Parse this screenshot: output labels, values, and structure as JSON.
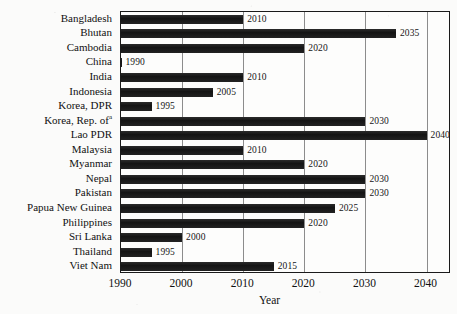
{
  "chart_data": {
    "type": "bar",
    "orientation": "horizontal",
    "title": "",
    "xlabel": "Year",
    "ylabel": "",
    "xlim": [
      1990,
      2044
    ],
    "xticks": [
      1990,
      2000,
      2010,
      2020,
      2030,
      2040
    ],
    "xtick_labels": [
      "1990",
      "2000",
      "2010",
      "2020",
      "2030",
      "2040"
    ],
    "grid": true,
    "grid_axis": "x",
    "legend": "none",
    "bar_color": "#1b1b1b",
    "categories": [
      "Bangladesh",
      "Bhutan",
      "Cambodia",
      "China",
      "India",
      "Indonesia",
      "Korea, DPR",
      "Korea, Rep. of",
      "Lao PDR",
      "Malaysia",
      "Myanmar",
      "Nepal",
      "Pakistan",
      "Papua New Guinea",
      "Philippines",
      "Sri Lanka",
      "Thailand",
      "Viet Nam"
    ],
    "values": [
      2010,
      2035,
      2020,
      1990,
      2010,
      2005,
      1995,
      2030,
      2040,
      2010,
      2020,
      2030,
      2030,
      2025,
      2020,
      2000,
      1995,
      2015
    ],
    "data_labels": [
      "2010",
      "2035",
      "2020",
      "1990",
      "2010",
      "2005",
      "1995",
      "2030",
      "2040",
      "2010",
      "2020",
      "2030",
      "2030",
      "2025",
      "2020",
      "2000",
      "1995",
      "2015"
    ],
    "footnote_markers": {
      "Korea, Rep. of": "a"
    }
  },
  "axis": {
    "x_title": "Year"
  }
}
